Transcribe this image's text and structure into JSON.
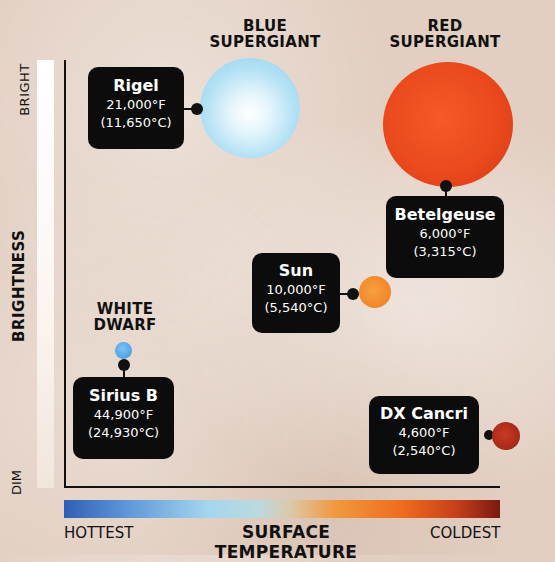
{
  "y_axis": {
    "title": "BRIGHTNESS",
    "top_label": "BRIGHT",
    "bottom_label": "DIM"
  },
  "x_axis": {
    "title": "SURFACE TEMPERATURE",
    "left_label": "HOTTEST",
    "right_label": "COLDEST",
    "gradient_colors": [
      "#2f5fb3",
      "#a4d6ef",
      "#dcc8a8",
      "#f09a40",
      "#ee6a1e",
      "#7a1a10"
    ]
  },
  "categories": {
    "blue_supergiant": {
      "line1": "BLUE",
      "line2": "SUPERGIANT"
    },
    "red_supergiant": {
      "line1": "RED",
      "line2": "SUPERGIANT"
    },
    "white_dwarf": {
      "line1": "WHITE",
      "line2": "DWARF"
    }
  },
  "stars": {
    "rigel": {
      "name": "Rigel",
      "temp_f": "21,000°F",
      "temp_c": "(11,650°C)",
      "color": "#a9dcf2"
    },
    "betelgeuse": {
      "name": "Betelgeuse",
      "temp_f": "6,000°F",
      "temp_c": "(3,315°C)",
      "color": "#e8401c"
    },
    "sun": {
      "name": "Sun",
      "temp_f": "10,000°F",
      "temp_c": "(5,540°C)",
      "color": "#f08a2a"
    },
    "sirius_b": {
      "name": "Sirius B",
      "temp_f": "44,900°F",
      "temp_c": "(24,930°C)",
      "color": "#4aa3e6"
    },
    "dx_cancri": {
      "name": "DX Cancri",
      "temp_f": "4,600°F",
      "temp_c": "(2,540°C)",
      "color": "#b0281a"
    }
  }
}
